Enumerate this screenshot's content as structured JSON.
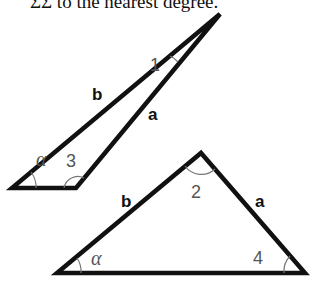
{
  "caption": "ΣΣ to the nearest degree.",
  "diagram": {
    "top_triangle": {
      "side_labels": {
        "b": "b",
        "a": "a"
      },
      "angle_labels": {
        "alpha": "α",
        "one": "1",
        "three": "3"
      }
    },
    "bottom_triangle": {
      "side_labels": {
        "b": "b",
        "a": "a"
      },
      "angle_labels": {
        "alpha": "α",
        "two": "2",
        "four": "4"
      }
    }
  }
}
